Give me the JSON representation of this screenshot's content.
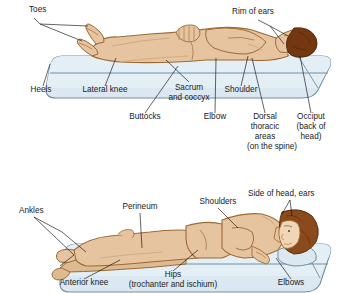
{
  "figure": {
    "colors": {
      "skin": "#e5c49f",
      "skin_shadow": "#d9b389",
      "outline": "#9c6b35",
      "hair_supine": "#73380f",
      "hair_side": "#8a4a1c",
      "mattress_fill": "#dbe8f1",
      "mattress_fill_shade": "#cbdde9",
      "mattress_outline": "#6f8fa6",
      "sheet_line": "#6f8fa6",
      "label_text": "#1a1a1a",
      "leader_line": "#111111",
      "background": "#ffffff"
    }
  },
  "panels": [
    {
      "id": "supine",
      "name": "supine-position-panel",
      "position_label": "Supine (back-lying)",
      "labels": [
        {
          "id": "toes",
          "name": "label-toes",
          "text": "Toes",
          "x": 29,
          "y": 12,
          "align": "start"
        },
        {
          "id": "heels",
          "name": "label-heels",
          "text": "Heels",
          "x": 41,
          "y": 92,
          "align": "middle"
        },
        {
          "id": "lateral",
          "name": "label-lateral-knee",
          "text": "Lateral knee",
          "x": 105,
          "y": 92,
          "align": "middle"
        },
        {
          "id": "sacrum1",
          "name": "label-sacrum",
          "text": "Sacrum",
          "x": 189,
          "y": 90,
          "align": "middle"
        },
        {
          "id": "sacrum2",
          "name": "label-sacrum-coccyx",
          "text": "and coccyx",
          "x": 189,
          "y": 100,
          "align": "middle"
        },
        {
          "id": "shoulder",
          "name": "label-shoulder",
          "text": "Shoulder",
          "x": 241,
          "y": 92,
          "align": "middle"
        },
        {
          "id": "rim",
          "name": "label-rim-of-ears",
          "text": "Rim of ears",
          "x": 232,
          "y": 14,
          "align": "start"
        },
        {
          "id": "buttocks",
          "name": "label-buttocks",
          "text": "Buttocks",
          "x": 145,
          "y": 119,
          "align": "middle"
        },
        {
          "id": "elbow",
          "name": "label-elbow",
          "text": "Elbow",
          "x": 215,
          "y": 119,
          "align": "middle"
        },
        {
          "id": "dorsal1",
          "name": "label-dorsal",
          "text": "Dorsal",
          "x": 265,
          "y": 119,
          "align": "middle"
        },
        {
          "id": "dorsal2",
          "name": "label-thoracic",
          "text": "thoracic",
          "x": 265,
          "y": 129,
          "align": "middle"
        },
        {
          "id": "dorsal3",
          "name": "label-areas",
          "text": "areas",
          "x": 265,
          "y": 139,
          "align": "middle"
        },
        {
          "id": "dorsal4",
          "name": "label-on-the-spine",
          "text": "(on the spine)",
          "x": 272,
          "y": 149,
          "align": "middle"
        },
        {
          "id": "occiput1",
          "name": "label-occiput",
          "text": "Occiput",
          "x": 311,
          "y": 119,
          "align": "middle"
        },
        {
          "id": "occiput2",
          "name": "label-back-of",
          "text": "(back of",
          "x": 311,
          "y": 129,
          "align": "middle"
        },
        {
          "id": "occiput3",
          "name": "label-head",
          "text": "head)",
          "x": 311,
          "y": 139,
          "align": "middle"
        }
      ]
    },
    {
      "id": "side-lying",
      "name": "side-lying-position-panel",
      "position_label": "Side-lying (lateral)",
      "labels": [
        {
          "id": "ankles",
          "name": "label-ankles",
          "text": "Ankles",
          "x": 19,
          "y": 213,
          "align": "start"
        },
        {
          "id": "perineum",
          "name": "label-perineum",
          "text": "Perineum",
          "x": 140,
          "y": 209,
          "align": "middle"
        },
        {
          "id": "shoulders",
          "name": "label-shoulders",
          "text": "Shoulders",
          "x": 218,
          "y": 204,
          "align": "middle"
        },
        {
          "id": "sidehead",
          "name": "label-side-of-head-ears",
          "text": "Side of head, ears",
          "x": 248,
          "y": 196,
          "align": "start"
        },
        {
          "id": "antknee",
          "name": "label-anterior-knee",
          "text": "Anterior knee",
          "x": 84,
          "y": 285,
          "align": "middle"
        },
        {
          "id": "hips1",
          "name": "label-hips",
          "text": "Hips",
          "x": 173,
          "y": 277,
          "align": "middle"
        },
        {
          "id": "hips2",
          "name": "label-trochanter-ischium",
          "text": "(trochanter and ischium)",
          "x": 173,
          "y": 287,
          "align": "middle"
        },
        {
          "id": "elbows",
          "name": "label-elbows",
          "text": "Elbows",
          "x": 291,
          "y": 285,
          "align": "middle"
        }
      ]
    }
  ]
}
